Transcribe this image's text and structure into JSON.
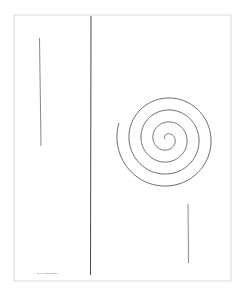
{
  "artwork": {
    "background": "#ffffff",
    "frame": {
      "x": 14,
      "y": 15,
      "width": 217,
      "height": 266,
      "stroke": "#d0d0d0"
    },
    "lines": [
      {
        "name": "center-vertical-line",
        "x1": 91,
        "y1": 16,
        "x2": 90.5,
        "y2": 275,
        "stroke": "#333333",
        "width": 0.9
      },
      {
        "name": "left-short-line",
        "x1": 39.5,
        "y1": 38,
        "x2": 41,
        "y2": 146,
        "stroke": "#555555",
        "width": 0.7
      },
      {
        "name": "right-short-line",
        "x1": 188,
        "y1": 204,
        "x2": 188.5,
        "y2": 263,
        "stroke": "#555555",
        "width": 0.7
      }
    ],
    "spiral": {
      "cx": 167,
      "cy": 139,
      "start_radius": 2,
      "growth_per_turn": 12,
      "turns": 4.05,
      "start_angle_deg": 180,
      "stroke": "#444444",
      "width": 0.8
    },
    "caption": "© Jill Kalman Studio"
  }
}
